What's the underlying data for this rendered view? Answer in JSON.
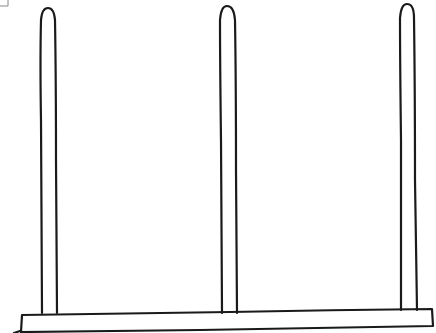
{
  "diagram": {
    "stroke_color": "#1a1a1a",
    "background": "#ffffff",
    "pegs": [
      {
        "name": "left",
        "x_center": 49,
        "top": 8,
        "bottom": 313
      },
      {
        "name": "middle",
        "x_center": 228,
        "top": 6,
        "bottom": 313
      },
      {
        "name": "right",
        "x_center": 408,
        "top": 4,
        "bottom": 310
      }
    ],
    "base": {
      "left": 21,
      "right": 434,
      "top": 313,
      "bottom": 331
    }
  }
}
